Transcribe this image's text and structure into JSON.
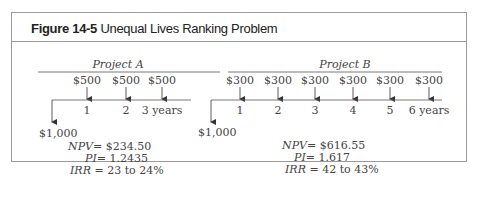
{
  "figure": {
    "label": "Figure 14-5",
    "title": "Unequal Lives Ranking Problem"
  },
  "projects": [
    {
      "name": "Project A",
      "initial_outflow": "$1,000",
      "inflows": [
        "$500",
        "$500",
        "$500"
      ],
      "periods": [
        "1",
        "2",
        "3 years"
      ],
      "metrics": {
        "npv_label": "NPV",
        "npv_value": "= $234.50",
        "pi_label": "PI",
        "pi_value": "= 1.2435",
        "irr_label": "IRR",
        "irr_value": " = 23 to 24%"
      }
    },
    {
      "name": "Project B",
      "initial_outflow": "$1,000",
      "inflows": [
        "$300",
        "$300",
        "$300",
        "$300",
        "$300",
        "$300"
      ],
      "periods": [
        "1",
        "2",
        "3",
        "4",
        "5",
        "6 years"
      ],
      "metrics": {
        "npv_label": "NPV",
        "npv_value": "= $616.55",
        "pi_label": "PI",
        "pi_value": "= 1.617",
        "irr_label": "IRR",
        "irr_value": " = 42 to 43%"
      }
    }
  ]
}
